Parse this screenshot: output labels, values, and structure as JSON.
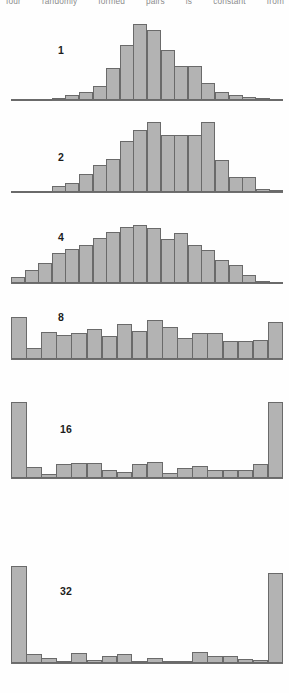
{
  "figure": {
    "caption_running_text": "four randomly formed pairs is constant from",
    "caption_words": [
      "four",
      "randomly",
      "formed",
      "pairs",
      "is",
      "constant",
      "from"
    ],
    "bar_fill_color": "#b3b3b3",
    "bar_stroke_color": "#6a6a6a",
    "axis_color": "#6f6f6f",
    "background_color": "#fefefe",
    "label_color": "#1c1c1c"
  },
  "chart_data": {
    "type": "bar",
    "title": "",
    "subtitle": "",
    "xlabel": "",
    "ylabel": "",
    "grid": false,
    "legend_position": "none",
    "panels": [
      {
        "label": "1",
        "label_x": 58,
        "label_y": 45,
        "axis_y": 100,
        "axis_x0": 11,
        "axis_x1": 283,
        "bar_x0": 11,
        "bar_x1": 283,
        "n_bins": 20,
        "max_height": 76,
        "values": [
          0.5,
          0.5,
          1,
          2,
          6,
          10,
          19,
          42,
          73,
          100,
          92,
          66,
          45,
          45,
          22,
          10,
          6,
          4,
          2,
          1
        ]
      },
      {
        "label": "2",
        "label_x": 58,
        "label_y": 152,
        "axis_y": 192,
        "axis_x0": 11,
        "axis_x1": 283,
        "bar_x0": 11,
        "bar_x1": 283,
        "n_bins": 20,
        "max_height": 70,
        "values": [
          1,
          1,
          2,
          9,
          13,
          26,
          38,
          47,
          73,
          88,
          100,
          82,
          82,
          82,
          100,
          46,
          21,
          21,
          5,
          3
        ]
      },
      {
        "label": "4",
        "label_x": 58,
        "label_y": 232,
        "axis_y": 283,
        "axis_x0": 11,
        "axis_x1": 283,
        "bar_x0": 11,
        "bar_x1": 283,
        "n_bins": 20,
        "max_height": 58,
        "values": [
          11,
          22,
          34,
          52,
          58,
          65,
          78,
          88,
          96,
          100,
          94,
          76,
          86,
          66,
          57,
          40,
          31,
          14,
          4,
          2
        ]
      },
      {
        "label": "8",
        "label_x": 58,
        "label_y": 312,
        "axis_y": 359,
        "axis_x0": 11,
        "axis_x1": 283,
        "bar_x0": 11,
        "bar_x1": 283,
        "n_bins": 18,
        "max_height": 42,
        "values": [
          100,
          26,
          64,
          58,
          62,
          72,
          54,
          84,
          66,
          94,
          76,
          50,
          62,
          62,
          44,
          44,
          46,
          88
        ]
      },
      {
        "label": "16",
        "label_x": 60,
        "label_y": 424,
        "axis_y": 478,
        "axis_x0": 11,
        "axis_x1": 283,
        "bar_x0": 11,
        "bar_x1": 283,
        "n_bins": 18,
        "max_height": 76,
        "values": [
          100,
          15,
          5,
          18,
          20,
          20,
          10,
          8,
          18,
          21,
          6,
          13,
          16,
          10,
          10,
          10,
          19,
          100
        ]
      },
      {
        "label": "32",
        "label_x": 60,
        "label_y": 586,
        "axis_y": 663,
        "axis_x0": 11,
        "axis_x1": 283,
        "bar_x0": 11,
        "bar_x1": 283,
        "n_bins": 18,
        "max_height": 97,
        "values": [
          100,
          9,
          5,
          2,
          10,
          3,
          7,
          9,
          2,
          5,
          2,
          2,
          11,
          7,
          7,
          4,
          3,
          93
        ]
      }
    ]
  }
}
